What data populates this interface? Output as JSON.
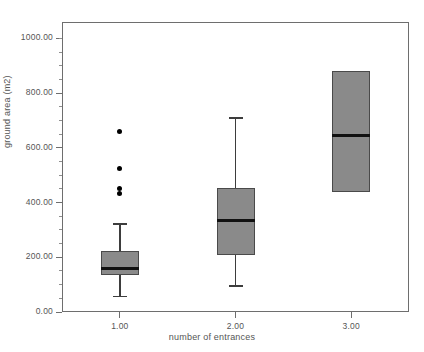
{
  "chart_data": {
    "type": "box",
    "title": "",
    "xlabel": "number of entrances",
    "ylabel": "ground area (m2)",
    "xlim": [
      0.5,
      3.5
    ],
    "ylim": [
      0,
      1060
    ],
    "grid": false,
    "legend": "none",
    "categories": [
      "1.00",
      "2.00",
      "3.00"
    ],
    "x_tick_labels": [
      "1.00",
      "2.00",
      "3.00"
    ],
    "y_tick_labels": [
      "0.00",
      "200.00",
      "400.00",
      "600.00",
      "800.00",
      "1000.00"
    ],
    "y_tick_values": [
      0,
      200,
      400,
      600,
      800,
      1000
    ],
    "y_minor_tick_values": [
      50,
      100,
      150,
      250,
      300,
      350,
      450,
      500,
      550,
      650,
      700,
      750,
      850,
      900,
      950,
      1000
    ],
    "boxes": [
      {
        "category": "1.00",
        "x": 1.0,
        "whisker_low": 60,
        "q1": 137,
        "median": 158,
        "q3": 222,
        "whisker_high": 325,
        "outliers": [
          660,
          525,
          450,
          432
        ]
      },
      {
        "category": "2.00",
        "x": 2.0,
        "whisker_low": 98,
        "q1": 210,
        "median": 333,
        "q3": 455,
        "whisker_high": 712,
        "outliers": []
      },
      {
        "category": "3.00",
        "x": 3.0,
        "whisker_low": 440,
        "q1": 440,
        "median": 645,
        "q3": 880,
        "whisker_high": 880,
        "outliers": []
      }
    ],
    "colors": {
      "box_fill": "#8a8a8a",
      "box_edge": "#4a4a4a",
      "median": "#111111",
      "whisker": "#3d3d3d",
      "outlier": "#000000",
      "frame": "#6e6e6e",
      "text": "#555555",
      "background": "#ffffff"
    }
  }
}
